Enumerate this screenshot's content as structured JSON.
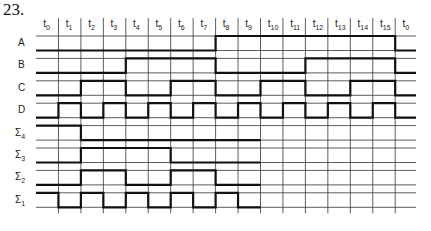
{
  "problem_number": "23.",
  "diagram": {
    "type": "timing-diagram",
    "time_labels": [
      {
        "base": "t",
        "sub": "0"
      },
      {
        "base": "t",
        "sub": "1"
      },
      {
        "base": "t",
        "sub": "2"
      },
      {
        "base": "t",
        "sub": "3"
      },
      {
        "base": "t",
        "sub": "4"
      },
      {
        "base": "t",
        "sub": "5"
      },
      {
        "base": "t",
        "sub": "6"
      },
      {
        "base": "t",
        "sub": "7"
      },
      {
        "base": "t",
        "sub": "8"
      },
      {
        "base": "t",
        "sub": "9"
      },
      {
        "base": "t",
        "sub": "10"
      },
      {
        "base": "t",
        "sub": "11"
      },
      {
        "base": "t",
        "sub": "12"
      },
      {
        "base": "t",
        "sub": "13"
      },
      {
        "base": "t",
        "sub": "14"
      },
      {
        "base": "t",
        "sub": "15"
      },
      {
        "base": "t",
        "sub": "0"
      }
    ],
    "signals": [
      {
        "name": "A",
        "sub": "",
        "levels": [
          0,
          0,
          0,
          0,
          0,
          0,
          0,
          0,
          1,
          1,
          1,
          1,
          1,
          1,
          1,
          1,
          0
        ]
      },
      {
        "name": "B",
        "sub": "",
        "levels": [
          0,
          0,
          0,
          0,
          1,
          1,
          1,
          1,
          0,
          0,
          0,
          0,
          1,
          1,
          1,
          1,
          0
        ]
      },
      {
        "name": "C",
        "sub": "",
        "levels": [
          0,
          0,
          1,
          1,
          0,
          0,
          1,
          1,
          0,
          0,
          1,
          1,
          0,
          0,
          1,
          1,
          0
        ]
      },
      {
        "name": "D",
        "sub": "",
        "levels": [
          0,
          1,
          0,
          1,
          0,
          1,
          0,
          1,
          0,
          1,
          0,
          1,
          0,
          1,
          0,
          1,
          0
        ]
      },
      {
        "name": "Σ",
        "sub": "4",
        "levels": [
          1,
          1,
          0,
          0,
          0,
          0,
          0,
          0,
          0,
          0
        ]
      },
      {
        "name": "Σ",
        "sub": "3",
        "levels": [
          0,
          0,
          1,
          1,
          1,
          1,
          0,
          0,
          0,
          0
        ]
      },
      {
        "name": "Σ",
        "sub": "2",
        "levels": [
          0,
          0,
          1,
          1,
          0,
          0,
          1,
          1,
          0,
          0
        ]
      },
      {
        "name": "Σ",
        "sub": "1",
        "levels": [
          1,
          0,
          1,
          0,
          1,
          0,
          1,
          0,
          1,
          0
        ]
      }
    ]
  }
}
